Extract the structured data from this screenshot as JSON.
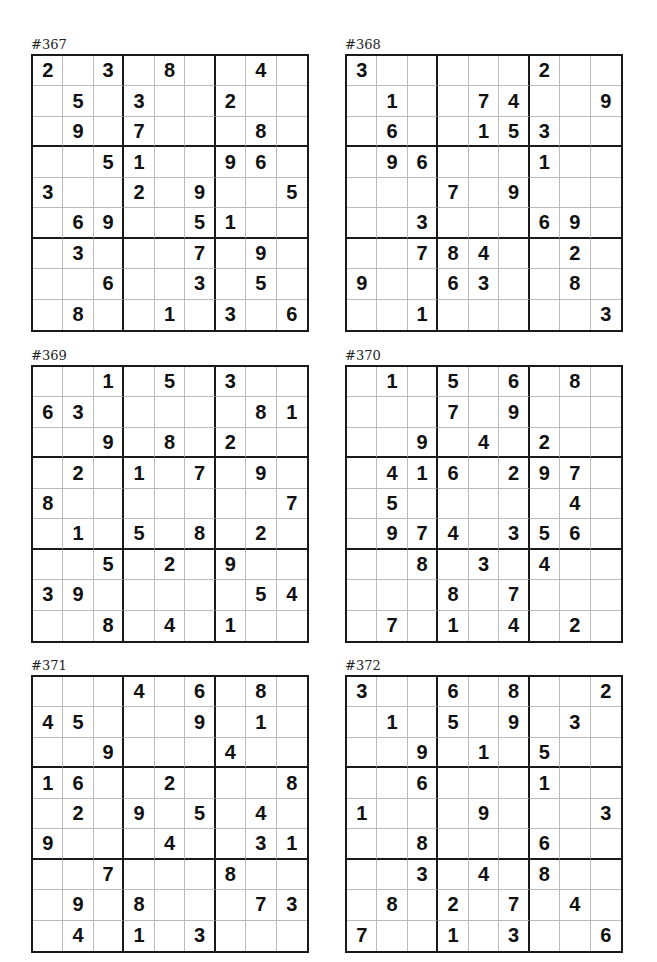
{
  "puzzles": [
    {
      "title": "#367",
      "grid": [
        [
          2,
          0,
          3,
          0,
          8,
          0,
          0,
          4,
          0
        ],
        [
          0,
          5,
          0,
          3,
          0,
          0,
          2,
          0,
          0
        ],
        [
          0,
          9,
          0,
          7,
          0,
          0,
          0,
          8,
          0
        ],
        [
          0,
          0,
          5,
          1,
          0,
          0,
          9,
          6,
          0
        ],
        [
          3,
          0,
          0,
          2,
          0,
          9,
          0,
          0,
          5
        ],
        [
          0,
          6,
          9,
          0,
          0,
          5,
          1,
          0,
          0
        ],
        [
          0,
          3,
          0,
          0,
          0,
          7,
          0,
          9,
          0
        ],
        [
          0,
          0,
          6,
          0,
          0,
          3,
          0,
          5,
          0
        ],
        [
          0,
          8,
          0,
          0,
          1,
          0,
          3,
          0,
          6
        ]
      ]
    },
    {
      "title": "#368",
      "grid": [
        [
          3,
          0,
          0,
          0,
          0,
          0,
          2,
          0,
          0
        ],
        [
          0,
          1,
          0,
          0,
          7,
          4,
          0,
          0,
          9
        ],
        [
          0,
          6,
          0,
          0,
          1,
          5,
          3,
          0,
          0
        ],
        [
          0,
          9,
          6,
          0,
          0,
          0,
          1,
          0,
          0
        ],
        [
          0,
          0,
          0,
          7,
          0,
          9,
          0,
          0,
          0
        ],
        [
          0,
          0,
          3,
          0,
          0,
          0,
          6,
          9,
          0
        ],
        [
          0,
          0,
          7,
          8,
          4,
          0,
          0,
          2,
          0
        ],
        [
          9,
          0,
          0,
          6,
          3,
          0,
          0,
          8,
          0
        ],
        [
          0,
          0,
          1,
          0,
          0,
          0,
          0,
          0,
          3
        ]
      ]
    },
    {
      "title": "#369",
      "grid": [
        [
          0,
          0,
          1,
          0,
          5,
          0,
          3,
          0,
          0
        ],
        [
          6,
          3,
          0,
          0,
          0,
          0,
          0,
          8,
          1
        ],
        [
          0,
          0,
          9,
          0,
          8,
          0,
          2,
          0,
          0
        ],
        [
          0,
          2,
          0,
          1,
          0,
          7,
          0,
          9,
          0
        ],
        [
          8,
          0,
          0,
          0,
          0,
          0,
          0,
          0,
          7
        ],
        [
          0,
          1,
          0,
          5,
          0,
          8,
          0,
          2,
          0
        ],
        [
          0,
          0,
          5,
          0,
          2,
          0,
          9,
          0,
          0
        ],
        [
          3,
          9,
          0,
          0,
          0,
          0,
          0,
          5,
          4
        ],
        [
          0,
          0,
          8,
          0,
          4,
          0,
          1,
          0,
          0
        ]
      ]
    },
    {
      "title": "#370",
      "grid": [
        [
          0,
          1,
          0,
          5,
          0,
          6,
          0,
          8,
          0
        ],
        [
          0,
          0,
          0,
          7,
          0,
          9,
          0,
          0,
          0
        ],
        [
          0,
          0,
          9,
          0,
          4,
          0,
          2,
          0,
          0
        ],
        [
          0,
          4,
          1,
          6,
          0,
          2,
          9,
          7,
          0
        ],
        [
          0,
          5,
          0,
          0,
          0,
          0,
          0,
          4,
          0
        ],
        [
          0,
          9,
          7,
          4,
          0,
          3,
          5,
          6,
          0
        ],
        [
          0,
          0,
          8,
          0,
          3,
          0,
          4,
          0,
          0
        ],
        [
          0,
          0,
          0,
          8,
          0,
          7,
          0,
          0,
          0
        ],
        [
          0,
          7,
          0,
          1,
          0,
          4,
          0,
          2,
          0
        ]
      ]
    },
    {
      "title": "#371",
      "grid": [
        [
          0,
          0,
          0,
          4,
          0,
          6,
          0,
          8,
          0
        ],
        [
          4,
          5,
          0,
          0,
          0,
          9,
          0,
          1,
          0
        ],
        [
          0,
          0,
          9,
          0,
          0,
          0,
          4,
          0,
          0
        ],
        [
          1,
          6,
          0,
          0,
          2,
          0,
          0,
          0,
          8
        ],
        [
          0,
          2,
          0,
          9,
          0,
          5,
          0,
          4,
          0
        ],
        [
          9,
          0,
          0,
          0,
          4,
          0,
          0,
          3,
          1
        ],
        [
          0,
          0,
          7,
          0,
          0,
          0,
          8,
          0,
          0
        ],
        [
          0,
          9,
          0,
          8,
          0,
          0,
          0,
          7,
          3
        ],
        [
          0,
          4,
          0,
          1,
          0,
          3,
          0,
          0,
          0
        ]
      ]
    },
    {
      "title": "#372",
      "grid": [
        [
          3,
          0,
          0,
          6,
          0,
          8,
          0,
          0,
          2
        ],
        [
          0,
          1,
          0,
          5,
          0,
          9,
          0,
          3,
          0
        ],
        [
          0,
          0,
          9,
          0,
          1,
          0,
          5,
          0,
          0
        ],
        [
          0,
          0,
          6,
          0,
          0,
          0,
          1,
          0,
          0
        ],
        [
          1,
          0,
          0,
          0,
          9,
          0,
          0,
          0,
          3
        ],
        [
          0,
          0,
          8,
          0,
          0,
          0,
          6,
          0,
          0
        ],
        [
          0,
          0,
          3,
          0,
          4,
          0,
          8,
          0,
          0
        ],
        [
          0,
          8,
          0,
          2,
          0,
          7,
          0,
          4,
          0
        ],
        [
          7,
          0,
          0,
          1,
          0,
          3,
          0,
          0,
          6
        ]
      ]
    }
  ]
}
